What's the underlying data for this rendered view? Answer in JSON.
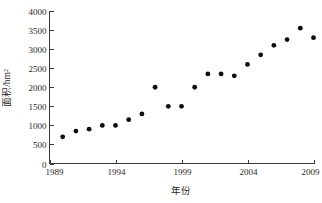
{
  "chart_data": {
    "type": "scatter",
    "title": "",
    "subtitle": "",
    "xlabel": "年份",
    "ylabel": "面积/hm²",
    "xlim": [
      1989,
      2009
    ],
    "ylim": [
      0,
      4000
    ],
    "xticks": [
      1989,
      1994,
      1999,
      2004,
      2009
    ],
    "xtick_labels": [
      "1989",
      "1994",
      "1999",
      "2004",
      "2009"
    ],
    "yticks": [
      0,
      500,
      1000,
      1500,
      2000,
      2500,
      3000,
      3500,
      4000
    ],
    "ytick_labels": [
      "0",
      "500",
      "1000",
      "1500",
      "2000",
      "2500",
      "3000",
      "3500",
      "4000"
    ],
    "grid": false,
    "legend": null,
    "legend_position": "none",
    "marker": "filled-circle",
    "marker_color": "#0d0d0d",
    "marker_size_px": 4.6,
    "x": [
      1990,
      1991,
      1992,
      1993,
      1994,
      1995,
      1996,
      1997,
      1998,
      1999,
      2000,
      2001,
      2002,
      2003,
      2004,
      2005,
      2006,
      2007,
      2008,
      2009
    ],
    "values": [
      700,
      850,
      900,
      1000,
      1000,
      1150,
      1300,
      2000,
      1500,
      1500,
      2000,
      2350,
      2350,
      2300,
      2600,
      2850,
      3100,
      3250,
      3550,
      3300
    ],
    "points": [
      {
        "x": 1990,
        "y": 700
      },
      {
        "x": 1991,
        "y": 850
      },
      {
        "x": 1992,
        "y": 900
      },
      {
        "x": 1993,
        "y": 1000
      },
      {
        "x": 1994,
        "y": 1000
      },
      {
        "x": 1995,
        "y": 1150
      },
      {
        "x": 1996,
        "y": 1300
      },
      {
        "x": 1997,
        "y": 2000
      },
      {
        "x": 1998,
        "y": 1500
      },
      {
        "x": 1999,
        "y": 1500
      },
      {
        "x": 2000,
        "y": 2000
      },
      {
        "x": 2001,
        "y": 2350
      },
      {
        "x": 2002,
        "y": 2350
      },
      {
        "x": 2003,
        "y": 2300
      },
      {
        "x": 2004,
        "y": 2600
      },
      {
        "x": 2005,
        "y": 2850
      },
      {
        "x": 2006,
        "y": 3100
      },
      {
        "x": 2007,
        "y": 3250
      },
      {
        "x": 2008,
        "y": 3550
      },
      {
        "x": 2009,
        "y": 3300
      }
    ]
  },
  "axes": {
    "y_title": "面积/hm²",
    "x_title": "年份"
  }
}
